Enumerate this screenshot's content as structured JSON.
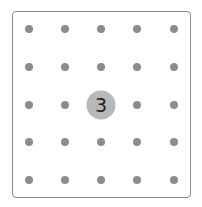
{
  "board": {
    "columns": 5,
    "rows": 5,
    "colors": {
      "dot": "#8c8c8c",
      "node": "#b8b8b8",
      "border": "#8a8a8a"
    },
    "active_node": {
      "row": 2,
      "col": 2,
      "label": "3"
    }
  }
}
